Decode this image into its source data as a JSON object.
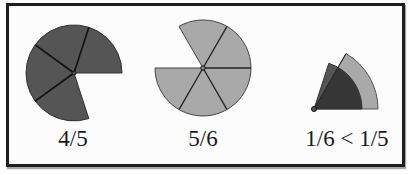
{
  "figures": [
    {
      "id": "four-fifths",
      "label": "4/5",
      "center": [
        74,
        73
      ],
      "radius": 48,
      "denominator": 5,
      "shaded_parts": 4,
      "fill": "#555555"
    },
    {
      "id": "five-sixths",
      "label": "5/6",
      "center": [
        203,
        68
      ],
      "radius": 48,
      "denominator": 6,
      "shaded_parts": 5,
      "fill": "#a9a9a9"
    },
    {
      "id": "comparison",
      "label": "1/6 < 1/5",
      "center": [
        314,
        109
      ],
      "sectors": [
        {
          "fraction": "1/6",
          "radius": 64,
          "fill": "#a9a9a9"
        },
        {
          "fraction": "1/5",
          "radius": 48,
          "fill": "#555555"
        }
      ],
      "overlap_fill": "#363636"
    }
  ],
  "colors": {
    "border": "#1e1e1e",
    "stroke": "#1a1a1a",
    "background": "#fcfcfc"
  }
}
